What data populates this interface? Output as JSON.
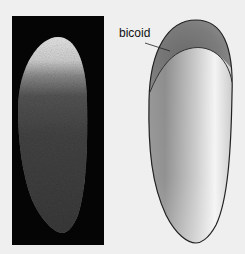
{
  "figure": {
    "label": "bicoid",
    "colors": {
      "background": "#efefef",
      "photo_panel": "#050505",
      "embryo_outline": "#222222"
    },
    "panels": [
      {
        "name": "fluorescence-photo",
        "description": "embryo micrograph with bright anterior staining"
      },
      {
        "name": "schematic-drawing",
        "description": "embryo diagram with anterior bicoid gradient cap"
      }
    ]
  }
}
